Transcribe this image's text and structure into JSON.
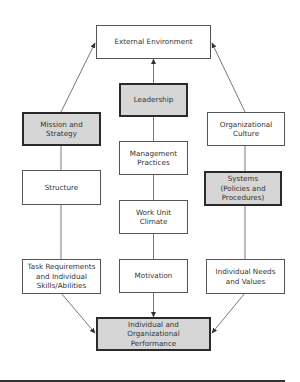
{
  "diagram": {
    "type": "organizational-performance-model",
    "colors": {
      "highlight_fill": "#d6d6d6",
      "box_fill": "#ffffff",
      "line": "#555555",
      "text": "#333333"
    },
    "nodes": {
      "external_environment": {
        "label": "External Environment",
        "highlighted": false
      },
      "leadership": {
        "label": "Leadership",
        "highlighted": true
      },
      "mission_strategy": {
        "label": "Mission and\nStrategy",
        "highlighted": true
      },
      "organizational_culture": {
        "label": "Organizational\nCulture",
        "highlighted": false
      },
      "management_practices": {
        "label": "Management\nPractices",
        "highlighted": false
      },
      "structure": {
        "label": "Structure",
        "highlighted": false
      },
      "systems": {
        "label": "Systems\n(Policies and\nProcedures)",
        "highlighted": true
      },
      "work_unit_climate": {
        "label": "Work Unit\nClimate",
        "highlighted": false
      },
      "task_requirements": {
        "label": "Task Requirements\nand Individual\nSkills/Abilities",
        "highlighted": false
      },
      "motivation": {
        "label": "Motivation",
        "highlighted": false
      },
      "individual_needs": {
        "label": "Individual Needs\nand Values",
        "highlighted": false
      },
      "performance": {
        "label": "Individual and Organizational\nPerformance",
        "highlighted": true
      }
    },
    "edges": [
      {
        "from": "mission_strategy",
        "to": "external_environment",
        "arrow": true
      },
      {
        "from": "leadership",
        "to": "external_environment",
        "arrow": true
      },
      {
        "from": "organizational_culture",
        "to": "external_environment",
        "arrow": true
      },
      {
        "from": "leadership",
        "to": "management_practices",
        "arrow": false
      },
      {
        "from": "mission_strategy",
        "to": "structure",
        "arrow": false
      },
      {
        "from": "organizational_culture",
        "to": "systems",
        "arrow": false
      },
      {
        "from": "management_practices",
        "to": "work_unit_climate",
        "arrow": false
      },
      {
        "from": "structure",
        "to": "task_requirements",
        "arrow": false
      },
      {
        "from": "work_unit_climate",
        "to": "motivation",
        "arrow": false
      },
      {
        "from": "systems",
        "to": "individual_needs",
        "arrow": false
      },
      {
        "from": "task_requirements",
        "to": "performance",
        "arrow": true
      },
      {
        "from": "motivation",
        "to": "performance",
        "arrow": true
      },
      {
        "from": "individual_needs",
        "to": "performance",
        "arrow": true
      }
    ]
  }
}
